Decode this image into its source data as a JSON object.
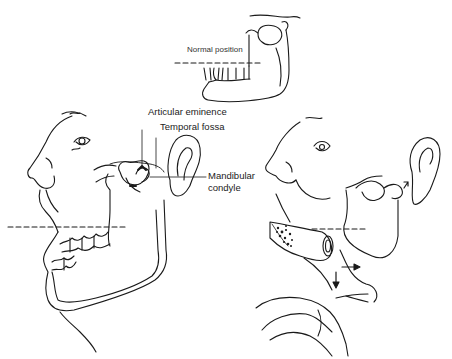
{
  "figure": {
    "panels": [
      {
        "id": "normal",
        "caption": "Normal position"
      },
      {
        "id": "dislocated-open",
        "labels": [
          "Articular eminence",
          "Temporal fossa",
          "Mandibular condyle"
        ]
      },
      {
        "id": "reduction-maneuver"
      }
    ]
  },
  "labels": {
    "normal_position": "Normal position",
    "articular_eminence": "Articular eminence",
    "temporal_fossa": "Temporal fossa",
    "mandibular_line1": "Mandibular",
    "mandibular_line2": "condyle"
  },
  "colors": {
    "ink": "#1a1a1a",
    "background": "#ffffff"
  }
}
